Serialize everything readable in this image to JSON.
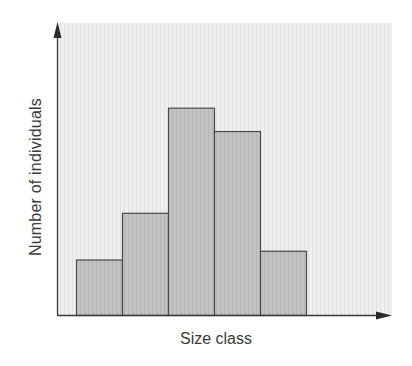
{
  "chart_data": {
    "type": "bar",
    "subtype": "histogram",
    "title": "",
    "xlabel": "Size class",
    "ylabel": "Number of individuals",
    "categories": [
      "1",
      "2",
      "3",
      "4",
      "5"
    ],
    "values": [
      19,
      35,
      71,
      63,
      22
    ],
    "value_units": "relative (no numeric scale shown; % of axis height)",
    "ylim": [
      0,
      100
    ],
    "grid": false,
    "legend": null,
    "tick_labels_shown": false,
    "colors": {
      "bar_fill": "#bdbdbd",
      "bar_edge": "#4a4a4a",
      "plot_background": "#ececec",
      "axis": "#3a3a3a"
    }
  }
}
